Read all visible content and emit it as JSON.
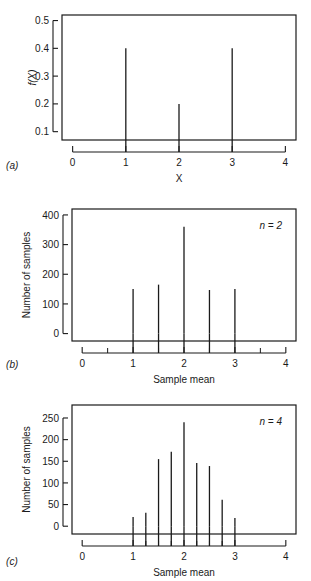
{
  "figure": {
    "background": "#ffffff",
    "ink": "#1a1a1a",
    "panels": [
      {
        "letter": "(a)",
        "xlabel": "X",
        "ylabel": "f(X)",
        "annotation": "",
        "xticklabels": [
          "0",
          "1",
          "2",
          "3",
          "4"
        ],
        "yticklabels": [
          "0.1",
          "0.2",
          "0.3",
          "0.4",
          "0.5"
        ]
      },
      {
        "letter": "(b)",
        "xlabel": "Sample mean",
        "ylabel": "Number of samples",
        "annotation": "n = 2",
        "xticklabels": [
          "0",
          "1",
          "2",
          "3",
          "4"
        ],
        "yticklabels": [
          "0",
          "100",
          "200",
          "300",
          "400"
        ]
      },
      {
        "letter": "(c)",
        "xlabel": "Sample mean",
        "ylabel": "Number of samples",
        "annotation": "n = 4",
        "xticklabels": [
          "0",
          "1",
          "2",
          "3",
          "4"
        ],
        "yticklabels": [
          "0",
          "50",
          "100",
          "150",
          "200",
          "250"
        ]
      }
    ]
  },
  "chart_data": [
    {
      "type": "bar",
      "panel": "a",
      "title": "",
      "xlabel": "X",
      "ylabel": "f(X)",
      "annotation": "",
      "x": [
        1,
        2,
        3
      ],
      "values": [
        0.4,
        0.2,
        0.4
      ],
      "categories": [
        "1",
        "2",
        "3"
      ],
      "xlim": [
        -0.2,
        4.2
      ],
      "ylim": [
        0.07,
        0.52
      ],
      "xticks": [
        0,
        1,
        2,
        3,
        4
      ],
      "yticks": [
        0.1,
        0.2,
        0.3,
        0.4,
        0.5
      ],
      "xminorticks": [],
      "grid": false,
      "legend": "none",
      "baseline": 0.07
    },
    {
      "type": "bar",
      "panel": "b",
      "title": "",
      "xlabel": "Sample mean",
      "ylabel": "Number of samples",
      "annotation": "n = 2",
      "x": [
        1,
        1.5,
        2,
        2.5,
        3
      ],
      "values": [
        150,
        165,
        360,
        147,
        150
      ],
      "categories": [
        "1",
        "1.5",
        "2",
        "2.5",
        "3"
      ],
      "xlim": [
        -0.2,
        4.2
      ],
      "ylim": [
        -25,
        420
      ],
      "xticks": [
        0,
        1,
        2,
        3,
        4
      ],
      "yticks": [
        0,
        100,
        200,
        300,
        400
      ],
      "xminorticks": [
        0.5,
        1.5,
        2.5,
        3.5
      ],
      "grid": false,
      "legend": "none",
      "baseline": 0
    },
    {
      "type": "bar",
      "panel": "c",
      "title": "",
      "xlabel": "Sample mean",
      "ylabel": "Number of samples",
      "annotation": "n = 4",
      "x": [
        1,
        1.25,
        1.5,
        1.75,
        2,
        2.25,
        2.5,
        2.75,
        3
      ],
      "values": [
        21,
        31,
        155,
        172,
        240,
        146,
        139,
        61,
        19
      ],
      "categories": [
        "1",
        "1.25",
        "1.5",
        "1.75",
        "2",
        "2.25",
        "2.5",
        "2.75",
        "3"
      ],
      "xlim": [
        -0.2,
        4.2
      ],
      "ylim": [
        -18,
        280
      ],
      "xticks": [
        0,
        1,
        2,
        3,
        4
      ],
      "yticks": [
        0,
        50,
        100,
        150,
        200,
        250
      ],
      "xminorticks": [
        1.25,
        1.5,
        1.75,
        2.25,
        2.5,
        2.75
      ],
      "grid": false,
      "legend": "none",
      "baseline": 0
    }
  ]
}
